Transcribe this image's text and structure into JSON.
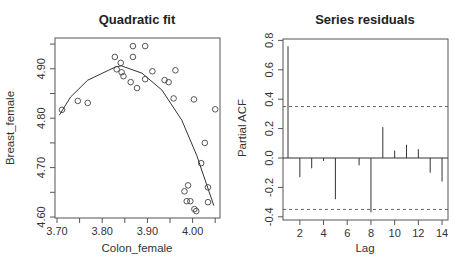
{
  "chart_data": [
    {
      "type": "scatter",
      "title": "Quadratic fit",
      "xlabel": "Colon_female",
      "ylabel": "Breast_female",
      "xlim": [
        3.7,
        4.05
      ],
      "ylim": [
        4.6,
        4.95
      ],
      "x_ticks": [
        3.7,
        3.75,
        3.8,
        3.85,
        3.9,
        3.95,
        4.0,
        4.05
      ],
      "x_tick_labels": [
        "3.70",
        "",
        "3.80",
        "",
        "3.90",
        "",
        "4.00",
        ""
      ],
      "y_ticks": [
        4.6,
        4.65,
        4.7,
        4.75,
        4.8,
        4.85,
        4.9,
        4.95
      ],
      "y_tick_labels": [
        "4.60",
        "",
        "4.70",
        "",
        "4.80",
        "",
        "4.90",
        ""
      ],
      "grid": false,
      "points": [
        [
          3.711,
          4.817
        ],
        [
          3.746,
          4.835
        ],
        [
          3.768,
          4.831
        ],
        [
          3.828,
          4.924
        ],
        [
          3.841,
          4.912
        ],
        [
          3.868,
          4.946
        ],
        [
          3.868,
          4.924
        ],
        [
          3.832,
          4.899
        ],
        [
          3.843,
          4.893
        ],
        [
          3.847,
          4.885
        ],
        [
          3.863,
          4.873
        ],
        [
          3.877,
          4.861
        ],
        [
          3.895,
          4.946
        ],
        [
          3.911,
          4.895
        ],
        [
          3.895,
          4.879
        ],
        [
          3.938,
          4.877
        ],
        [
          3.947,
          4.873
        ],
        [
          3.962,
          4.897
        ],
        [
          3.958,
          4.84
        ],
        [
          4.003,
          4.838
        ],
        [
          4.05,
          4.818
        ],
        [
          4.019,
          4.709
        ],
        [
          4.027,
          4.75
        ],
        [
          3.982,
          4.652
        ],
        [
          3.99,
          4.664
        ],
        [
          4.034,
          4.66
        ],
        [
          3.987,
          4.632
        ],
        [
          3.995,
          4.632
        ],
        [
          4.034,
          4.63
        ],
        [
          4.004,
          4.616
        ],
        [
          4.008,
          4.612
        ]
      ],
      "fit_line": [
        [
          3.705,
          4.806
        ],
        [
          3.73,
          4.843
        ],
        [
          3.768,
          4.877
        ],
        [
          3.83,
          4.904
        ],
        [
          3.842,
          4.906
        ],
        [
          3.888,
          4.891
        ],
        [
          3.932,
          4.857
        ],
        [
          3.976,
          4.796
        ],
        [
          4.009,
          4.725
        ],
        [
          4.047,
          4.623
        ]
      ]
    },
    {
      "type": "bar",
      "subtype": "pacf-stem",
      "title": "Series residuals",
      "xlabel": "Lag",
      "ylabel": "Partial ACF",
      "categories": [
        1,
        2,
        3,
        4,
        5,
        6,
        7,
        8,
        9,
        10,
        11,
        12,
        13,
        14
      ],
      "values": [
        0.76,
        -0.13,
        -0.07,
        -0.02,
        -0.28,
        0.0,
        -0.05,
        -0.37,
        0.21,
        0.05,
        0.09,
        0.06,
        -0.1,
        -0.16
      ],
      "xlim": [
        0.5,
        14.5
      ],
      "ylim": [
        -0.42,
        0.8
      ],
      "x_ticks": [
        2,
        4,
        6,
        8,
        10,
        12,
        14
      ],
      "y_ticks": [
        -0.4,
        -0.2,
        0.0,
        0.2,
        0.4,
        0.6,
        0.8
      ],
      "y_tick_labels": [
        "-0.4",
        "-0.2",
        "0.0",
        "0.2",
        "0.4",
        "0.6",
        "0.8"
      ],
      "confidence_bounds": [
        0.35,
        -0.35
      ],
      "grid": false
    }
  ]
}
